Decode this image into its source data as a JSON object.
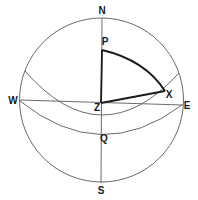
{
  "diagram": {
    "labels": {
      "north": "N",
      "south": "S",
      "west": "W",
      "east": "E",
      "pole": "P",
      "zenith": "Z",
      "star": "X",
      "equator_point": "Q"
    },
    "colors": {
      "line": "#5a5a5a",
      "triangle": "#1a1a1a",
      "background": "#ffffff"
    }
  }
}
